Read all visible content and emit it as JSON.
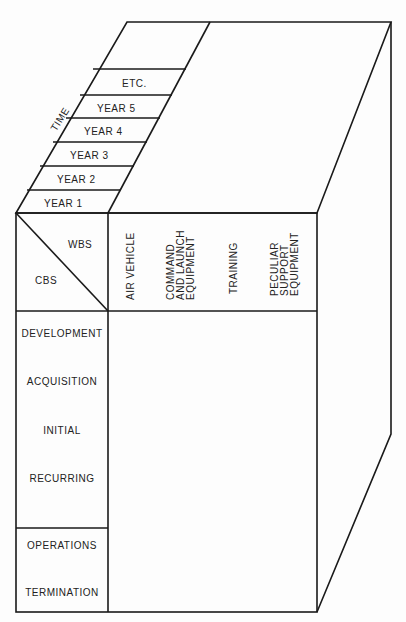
{
  "diagram": {
    "time_axis": {
      "label": "TIME",
      "years": [
        "YEAR 1",
        "YEAR 2",
        "YEAR 3",
        "YEAR 4",
        "YEAR 5",
        "ETC."
      ]
    },
    "header": {
      "wbs_label": "WBS",
      "cbs_label": "CBS"
    },
    "wbs_columns": [
      {
        "lines": [
          "AIR VEHICLE"
        ]
      },
      {
        "lines": [
          "COMMAND",
          "AND LAUNCH",
          "EQUIPMENT"
        ]
      },
      {
        "lines": [
          "TRAINING"
        ]
      },
      {
        "lines": [
          "PECULIAR",
          "SUPPORT",
          "EQUIPMENT"
        ]
      }
    ],
    "cbs_rows": {
      "group1": [
        "DEVELOPMENT",
        "ACQUISITION",
        "INITIAL",
        "RECURRING"
      ],
      "group2": [
        "OPERATIONS",
        "TERMINATION"
      ]
    },
    "colors": {
      "line": "#1a1a1a",
      "background": "#fdfdfd"
    }
  }
}
